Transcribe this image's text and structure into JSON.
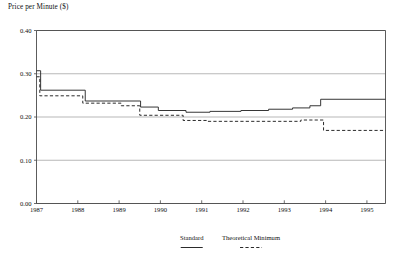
{
  "chart_data": {
    "type": "line",
    "title": "Price per Minute ($)",
    "xlabel": "",
    "ylabel": "Price per Minute ($)",
    "xlim": [
      1987,
      1995.45
    ],
    "ylim": [
      0.0,
      0.4
    ],
    "grid": true,
    "grid_axis": "y",
    "legend_position": "bottom",
    "yticks": [
      0.0,
      0.1,
      0.2,
      0.3,
      0.4
    ],
    "ytick_labels": [
      "0.00",
      "0.10",
      "0.20",
      "0.30",
      "0.40"
    ],
    "xticks": [
      1987,
      1988,
      1989,
      1990,
      1991,
      1992,
      1993,
      1994,
      1995
    ],
    "xtick_labels": [
      "1987",
      "1988",
      "1989",
      "1990",
      "1991",
      "1992",
      "1993",
      "1994",
      "1995"
    ],
    "series": [
      {
        "name": "Standard",
        "style": "solid",
        "color": "#2b2b2b",
        "points": [
          [
            1987.0,
            0.307
          ],
          [
            1987.1,
            0.307
          ],
          [
            1987.1,
            0.262
          ],
          [
            1988.18,
            0.262
          ],
          [
            1988.18,
            0.237
          ],
          [
            1989.52,
            0.237
          ],
          [
            1989.52,
            0.223
          ],
          [
            1989.95,
            0.223
          ],
          [
            1989.95,
            0.215
          ],
          [
            1990.62,
            0.215
          ],
          [
            1990.62,
            0.211
          ],
          [
            1991.2,
            0.211
          ],
          [
            1991.2,
            0.213
          ],
          [
            1991.95,
            0.213
          ],
          [
            1991.95,
            0.215
          ],
          [
            1992.62,
            0.215
          ],
          [
            1992.62,
            0.218
          ],
          [
            1993.2,
            0.218
          ],
          [
            1993.2,
            0.221
          ],
          [
            1993.62,
            0.221
          ],
          [
            1993.62,
            0.226
          ],
          [
            1993.88,
            0.226
          ],
          [
            1993.88,
            0.241
          ],
          [
            1995.45,
            0.241
          ]
        ]
      },
      {
        "name": "Theoretical Minimum",
        "style": "dashed",
        "color": "#2b2b2b",
        "points": [
          [
            1987.0,
            0.293
          ],
          [
            1987.08,
            0.293
          ],
          [
            1987.08,
            0.249
          ],
          [
            1988.12,
            0.249
          ],
          [
            1988.12,
            0.232
          ],
          [
            1989.05,
            0.232
          ],
          [
            1989.05,
            0.226
          ],
          [
            1989.5,
            0.226
          ],
          [
            1989.5,
            0.204
          ],
          [
            1990.55,
            0.204
          ],
          [
            1990.55,
            0.192
          ],
          [
            1991.15,
            0.192
          ],
          [
            1991.15,
            0.19
          ],
          [
            1993.4,
            0.19
          ],
          [
            1993.4,
            0.193
          ],
          [
            1993.95,
            0.193
          ],
          [
            1993.95,
            0.169
          ],
          [
            1995.45,
            0.169
          ]
        ]
      }
    ]
  },
  "legend": {
    "entries": [
      {
        "label": "Standard",
        "style": "solid"
      },
      {
        "label": "Theoretical Minimum",
        "style": "dashed"
      }
    ]
  }
}
